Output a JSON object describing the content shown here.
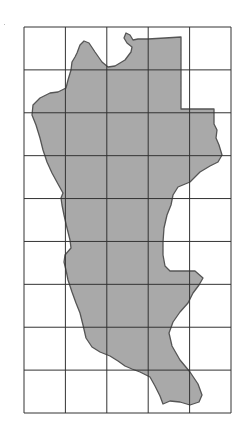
{
  "figure": {
    "grid": {
      "columns": 5,
      "rows": 9,
      "left": 24,
      "top": 27,
      "right": 231,
      "bottom": 413,
      "line_color": "#333333"
    },
    "region": {
      "fill_color": "#a9a9a9",
      "stroke_color": "#555555",
      "outline_points": [
        [
          84,
          41
        ],
        [
          89,
          43
        ],
        [
          95,
          52
        ],
        [
          102,
          62
        ],
        [
          108,
          67
        ],
        [
          115,
          66
        ],
        [
          125,
          60
        ],
        [
          131,
          52
        ],
        [
          132,
          47
        ],
        [
          127,
          43
        ],
        [
          124,
          38
        ],
        [
          126,
          33
        ],
        [
          130,
          35
        ],
        [
          133,
          40
        ],
        [
          138,
          39
        ],
        [
          148,
          39
        ],
        [
          165,
          38
        ],
        [
          181,
          37
        ],
        [
          181,
          109
        ],
        [
          214,
          109
        ],
        [
          214,
          124
        ],
        [
          217,
          130
        ],
        [
          216,
          138
        ],
        [
          219,
          145
        ],
        [
          222,
          155
        ],
        [
          218,
          162
        ],
        [
          210,
          166
        ],
        [
          200,
          172
        ],
        [
          190,
          182
        ],
        [
          178,
          187
        ],
        [
          173,
          195
        ],
        [
          171,
          205
        ],
        [
          167,
          215
        ],
        [
          164,
          228
        ],
        [
          163,
          242
        ],
        [
          163,
          255
        ],
        [
          165,
          266
        ],
        [
          170,
          271
        ],
        [
          185,
          271
        ],
        [
          195,
          271
        ],
        [
          203,
          278
        ],
        [
          199,
          285
        ],
        [
          193,
          293
        ],
        [
          188,
          303
        ],
        [
          180,
          312
        ],
        [
          173,
          322
        ],
        [
          169,
          333
        ],
        [
          172,
          346
        ],
        [
          180,
          360
        ],
        [
          190,
          372
        ],
        [
          198,
          384
        ],
        [
          202,
          395
        ],
        [
          199,
          402
        ],
        [
          190,
          405
        ],
        [
          180,
          402
        ],
        [
          170,
          401
        ],
        [
          163,
          404
        ],
        [
          160,
          396
        ],
        [
          155,
          386
        ],
        [
          150,
          377
        ],
        [
          140,
          372
        ],
        [
          132,
          369
        ],
        [
          125,
          366
        ],
        [
          118,
          361
        ],
        [
          110,
          356
        ],
        [
          100,
          352
        ],
        [
          92,
          347
        ],
        [
          86,
          338
        ],
        [
          83,
          325
        ],
        [
          80,
          313
        ],
        [
          76,
          303
        ],
        [
          72,
          292
        ],
        [
          68,
          280
        ],
        [
          66,
          270
        ],
        [
          64,
          262
        ],
        [
          65,
          255
        ],
        [
          71,
          248
        ],
        [
          70,
          240
        ],
        [
          67,
          228
        ],
        [
          64,
          215
        ],
        [
          62,
          205
        ],
        [
          61,
          198
        ],
        [
          63,
          193
        ],
        [
          58,
          184
        ],
        [
          52,
          173
        ],
        [
          47,
          162
        ],
        [
          43,
          150
        ],
        [
          40,
          138
        ],
        [
          36,
          125
        ],
        [
          32,
          115
        ],
        [
          33,
          105
        ],
        [
          40,
          98
        ],
        [
          50,
          93
        ],
        [
          58,
          92
        ],
        [
          66,
          88
        ],
        [
          68,
          80
        ],
        [
          71,
          70
        ],
        [
          72,
          62
        ],
        [
          75,
          57
        ],
        [
          77,
          53
        ],
        [
          80,
          45
        ]
      ]
    }
  }
}
